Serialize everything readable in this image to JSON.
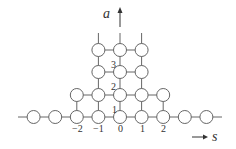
{
  "axes": {
    "vertical_label": "a",
    "horizontal_label": "s"
  },
  "s_ticks": [
    "−2",
    "−1",
    "0",
    "1",
    "2"
  ],
  "a_labels": [
    "1",
    "2",
    "3"
  ],
  "lattice": {
    "row0_columns": [
      -4,
      -3,
      -2,
      -1,
      0,
      1,
      2,
      3,
      4
    ],
    "row1_columns": [
      -2,
      -1,
      0,
      1,
      2
    ],
    "row2_columns": [
      -1,
      0,
      1
    ],
    "row3_columns": [
      -1,
      0,
      1
    ],
    "continues_upward_columns": [
      -1,
      0,
      1
    ]
  },
  "colors": {
    "line": "#666666",
    "node_fill": "#ffffff",
    "text": "#333333"
  }
}
